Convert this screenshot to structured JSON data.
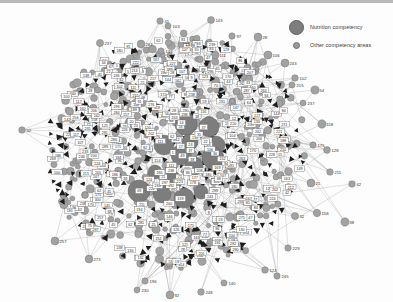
{
  "figure": {
    "title": "",
    "background_color": "#fdfdfd",
    "border_color": "#b9b9b9",
    "width": 393,
    "height": 302
  },
  "legend": {
    "position": "top-right",
    "items": [
      {
        "label": "Nutrition competency",
        "marker": "large-circle",
        "color": "#7d7d7d",
        "size": 13
      },
      {
        "label": "Other competency areas",
        "marker": "small-circle",
        "color": "#9a9a9a",
        "size": 5
      }
    ]
  },
  "chart_data": {
    "type": "scatter",
    "subtype": "network-graph",
    "title": "",
    "xlabel": "",
    "ylabel": "",
    "grid": false,
    "legend_position": "top-right",
    "layout": "force-directed-hairball",
    "node_colors": {
      "nutrition": "#7d7d7d",
      "other": "#a2a2a2",
      "arrow": "#1d1d1d",
      "label_box_fill": "#ffffff",
      "label_box_stroke": "#555555",
      "label_text": "#2a2a2a",
      "edge": "#8a8a8a"
    },
    "counts": {
      "nodes_total": 430,
      "nutrition_nodes": 14,
      "other_nodes": 416,
      "edges_total": 1150,
      "labeled_nodes": 300
    },
    "core": {
      "center_x": 176,
      "center_y": 150,
      "radius_x": 130,
      "radius_y": 118
    },
    "nutrition_nodes": [
      {
        "id": "n1",
        "x": 186,
        "y": 124,
        "r": 11
      },
      {
        "id": "n2",
        "x": 209,
        "y": 127,
        "r": 10
      },
      {
        "id": "n3",
        "x": 164,
        "y": 145,
        "r": 10
      },
      {
        "id": "n4",
        "x": 190,
        "y": 142,
        "r": 8
      },
      {
        "id": "n5",
        "x": 216,
        "y": 145,
        "r": 9
      },
      {
        "id": "n6",
        "x": 181,
        "y": 155,
        "r": 10
      },
      {
        "id": "n7",
        "x": 213,
        "y": 158,
        "r": 11
      },
      {
        "id": "n8",
        "x": 194,
        "y": 166,
        "r": 9
      },
      {
        "id": "n9",
        "x": 172,
        "y": 181,
        "r": 10
      },
      {
        "id": "n10",
        "x": 139,
        "y": 191,
        "r": 11
      },
      {
        "id": "n11",
        "x": 162,
        "y": 194,
        "r": 9
      },
      {
        "id": "n12",
        "x": 184,
        "y": 198,
        "r": 10
      },
      {
        "id": "n13",
        "x": 201,
        "y": 192,
        "r": 7
      },
      {
        "id": "n14",
        "x": 155,
        "y": 172,
        "r": 7
      }
    ],
    "peripheral_nodes": [
      {
        "label": "41",
        "x": 160,
        "y": 21
      },
      {
        "label": "103",
        "x": 168,
        "y": 26
      },
      {
        "label": "143",
        "x": 211,
        "y": 20
      },
      {
        "label": "97",
        "x": 232,
        "y": 36
      },
      {
        "label": "28",
        "x": 258,
        "y": 37
      },
      {
        "label": "106",
        "x": 268,
        "y": 55
      },
      {
        "label": "243",
        "x": 285,
        "y": 63
      },
      {
        "label": "237",
        "x": 100,
        "y": 43
      },
      {
        "label": "263",
        "x": 141,
        "y": 44
      },
      {
        "label": "133",
        "x": 161,
        "y": 51
      },
      {
        "label": "134",
        "x": 181,
        "y": 44
      },
      {
        "label": "111",
        "x": 215,
        "y": 55
      },
      {
        "label": "102",
        "x": 295,
        "y": 78
      },
      {
        "label": "215",
        "x": 292,
        "y": 85
      },
      {
        "label": "54",
        "x": 315,
        "y": 90
      },
      {
        "label": "237",
        "x": 303,
        "y": 103
      },
      {
        "label": "118",
        "x": 322,
        "y": 124
      },
      {
        "label": "175",
        "x": 313,
        "y": 145
      },
      {
        "label": "128",
        "x": 327,
        "y": 150
      },
      {
        "label": "211",
        "x": 330,
        "y": 172
      },
      {
        "label": "21",
        "x": 311,
        "y": 183
      },
      {
        "label": "42",
        "x": 352,
        "y": 184
      },
      {
        "label": "158",
        "x": 317,
        "y": 213
      },
      {
        "label": "38",
        "x": 345,
        "y": 222
      },
      {
        "label": "52",
        "x": 22,
        "y": 130
      },
      {
        "label": "257",
        "x": 55,
        "y": 241
      },
      {
        "label": "273",
        "x": 89,
        "y": 259
      },
      {
        "label": "229",
        "x": 288,
        "y": 248
      },
      {
        "label": "124",
        "x": 265,
        "y": 270
      },
      {
        "label": "245",
        "x": 277,
        "y": 276
      },
      {
        "label": "248",
        "x": 201,
        "y": 292
      },
      {
        "label": "92",
        "x": 170,
        "y": 295
      },
      {
        "label": "196",
        "x": 145,
        "y": 281
      },
      {
        "label": "230",
        "x": 137,
        "y": 290
      },
      {
        "label": "140",
        "x": 224,
        "y": 283
      },
      {
        "label": "32",
        "x": 295,
        "y": 216
      }
    ],
    "label_ids": [
      "1",
      "2",
      "3",
      "5",
      "7",
      "8",
      "9",
      "11",
      "12",
      "14",
      "15",
      "16",
      "17",
      "18",
      "19",
      "20",
      "21",
      "22",
      "23",
      "24",
      "25",
      "26",
      "27",
      "28",
      "29",
      "30",
      "31",
      "32",
      "33",
      "34",
      "35",
      "36",
      "37",
      "38",
      "39",
      "40",
      "41",
      "42",
      "43",
      "44",
      "45",
      "46",
      "47",
      "48",
      "49",
      "50",
      "51",
      "52",
      "53",
      "54",
      "55",
      "56",
      "57",
      "58",
      "59",
      "60",
      "61",
      "62",
      "63",
      "64",
      "65",
      "66",
      "67",
      "68",
      "69",
      "70",
      "71",
      "72",
      "73",
      "74",
      "75",
      "76",
      "77",
      "78",
      "79",
      "80",
      "81",
      "82",
      "83",
      "84",
      "85",
      "86",
      "87",
      "88",
      "89",
      "90",
      "91",
      "92",
      "93",
      "94",
      "95",
      "96",
      "97",
      "98",
      "99",
      "100",
      "101",
      "102",
      "103",
      "104",
      "105",
      "106",
      "107",
      "108",
      "109",
      "110",
      "111",
      "112",
      "113",
      "114",
      "115",
      "116",
      "117",
      "118",
      "119",
      "120",
      "121",
      "122",
      "123",
      "124",
      "125",
      "126",
      "127",
      "128",
      "129",
      "130",
      "131",
      "132",
      "133",
      "134",
      "135",
      "136",
      "137",
      "138",
      "139",
      "140",
      "141",
      "142",
      "143",
      "144",
      "145",
      "146",
      "147",
      "148",
      "149",
      "150",
      "151",
      "152",
      "153",
      "154",
      "155",
      "156",
      "157",
      "158",
      "159",
      "160",
      "161",
      "162",
      "163",
      "164",
      "165",
      "166",
      "167",
      "168",
      "169",
      "170",
      "171",
      "172",
      "173",
      "174",
      "175",
      "176",
      "177",
      "178",
      "179",
      "180",
      "181",
      "182",
      "183",
      "184",
      "185",
      "186",
      "187",
      "188",
      "189",
      "190",
      "191",
      "192",
      "193",
      "194",
      "195",
      "196",
      "197",
      "198",
      "199",
      "200",
      "201",
      "202",
      "203",
      "204",
      "205",
      "206",
      "207",
      "208",
      "209",
      "210",
      "211",
      "212",
      "213",
      "214",
      "215",
      "216",
      "217",
      "218",
      "219",
      "220",
      "221",
      "222",
      "223",
      "224",
      "225",
      "226",
      "227",
      "228",
      "229",
      "230",
      "231",
      "232",
      "233",
      "234",
      "235",
      "236",
      "237",
      "238",
      "239",
      "240",
      "241",
      "242",
      "243",
      "244",
      "245",
      "246",
      "247",
      "248",
      "249",
      "250",
      "251",
      "252",
      "253",
      "254",
      "255",
      "256",
      "257",
      "258",
      "259",
      "260",
      "261",
      "262",
      "263",
      "264",
      "265",
      "266",
      "267",
      "268",
      "269",
      "270",
      "271",
      "272",
      "273",
      "274",
      "275",
      "276",
      "277",
      "278",
      "279",
      "280",
      "281",
      "282",
      "283",
      "284",
      "285",
      "286",
      "287",
      "288",
      "289",
      "290",
      "291",
      "292",
      "293",
      "294",
      "295",
      "296",
      "297",
      "298",
      "299",
      "300"
    ]
  }
}
